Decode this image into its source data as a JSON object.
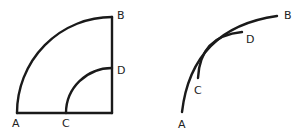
{
  "figures": [
    {
      "name": "quarter-circle-annulus",
      "description": "Two concentric quarter arcs AB and CD with radii along the base and right edge",
      "labels": {
        "A": "A",
        "B": "B",
        "C": "C",
        "D": "D"
      }
    },
    {
      "name": "tangent-arcs",
      "description": "Arc AB and arc CD tangent at a point, shorter arc CD inside",
      "labels": {
        "A": "A",
        "B": "B",
        "C": "C",
        "D": "D"
      }
    }
  ],
  "colors": {
    "stroke": "#1a1a1a",
    "background": "#ffffff"
  }
}
